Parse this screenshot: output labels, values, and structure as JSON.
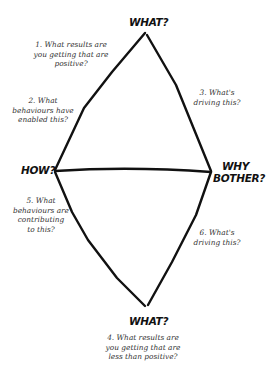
{
  "diagram": {
    "nodes": {
      "top": {
        "label": "WHAT?"
      },
      "left": {
        "label": "HOW?"
      },
      "right": {
        "label_line1": "WHY",
        "label_line2": "BOTHER?"
      },
      "bottom": {
        "label": "WHAT?"
      }
    },
    "questions": [
      {
        "number": 1,
        "text": "1. What results are\nyou getting that are\npositive?"
      },
      {
        "number": 2,
        "text": "2. What\nbehaviours have\nenabled this?"
      },
      {
        "number": 3,
        "text": "3. What's\ndriving this?"
      },
      {
        "number": 4,
        "text": "4. What results are\nyou getting that are\nless than positive?"
      },
      {
        "number": 5,
        "text": "5. What\nbehaviours are\ncontributing\nto this?"
      },
      {
        "number": 6,
        "text": "6. What's\ndriving this?"
      }
    ],
    "colors": {
      "line": "#111111",
      "text": "#333333",
      "background": "#ffffff"
    }
  }
}
